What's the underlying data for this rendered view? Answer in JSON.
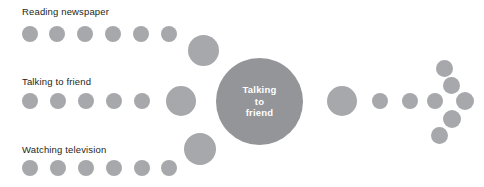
{
  "diagram": {
    "type": "bubble-flow",
    "background_color": "#ffffff",
    "node_color": "#a6a8ab",
    "hub_color": "#939598",
    "text_color": "#231f20",
    "hub": {
      "label_lines": [
        "Talking",
        "to",
        "friend"
      ],
      "x": 216,
      "y": 58,
      "size": 87
    },
    "labels": [
      {
        "text": "Reading newspaper",
        "x": 22,
        "y": 6
      },
      {
        "text": "Talking to friend",
        "x": 22,
        "y": 76
      },
      {
        "text": "Watching television",
        "x": 22,
        "y": 144
      }
    ],
    "nodes": [
      {
        "group": "reading-newspaper-row",
        "x": 22,
        "y": 26,
        "size": 16
      },
      {
        "group": "reading-newspaper-row",
        "x": 49,
        "y": 26,
        "size": 16
      },
      {
        "group": "reading-newspaper-row",
        "x": 77,
        "y": 26,
        "size": 16
      },
      {
        "group": "reading-newspaper-row",
        "x": 105,
        "y": 26,
        "size": 16
      },
      {
        "group": "reading-newspaper-row",
        "x": 133,
        "y": 26,
        "size": 16
      },
      {
        "group": "reading-newspaper-row",
        "x": 161,
        "y": 26,
        "size": 16
      },
      {
        "group": "reading-newspaper-merge",
        "x": 188,
        "y": 35,
        "size": 31
      },
      {
        "group": "talking-to-friend-row",
        "x": 22,
        "y": 93,
        "size": 16
      },
      {
        "group": "talking-to-friend-row",
        "x": 50,
        "y": 93,
        "size": 16
      },
      {
        "group": "talking-to-friend-row",
        "x": 78,
        "y": 93,
        "size": 16
      },
      {
        "group": "talking-to-friend-row",
        "x": 106,
        "y": 93,
        "size": 16
      },
      {
        "group": "talking-to-friend-row",
        "x": 134,
        "y": 93,
        "size": 16
      },
      {
        "group": "talking-to-friend-merge",
        "x": 166,
        "y": 86,
        "size": 30
      },
      {
        "group": "watching-television-row",
        "x": 22,
        "y": 160,
        "size": 16
      },
      {
        "group": "watching-television-row",
        "x": 50,
        "y": 160,
        "size": 16
      },
      {
        "group": "watching-television-row",
        "x": 78,
        "y": 160,
        "size": 16
      },
      {
        "group": "watching-television-row",
        "x": 106,
        "y": 160,
        "size": 16
      },
      {
        "group": "watching-television-row",
        "x": 134,
        "y": 160,
        "size": 16
      },
      {
        "group": "watching-television-row",
        "x": 161,
        "y": 160,
        "size": 16
      },
      {
        "group": "watching-television-merge",
        "x": 184,
        "y": 133,
        "size": 32
      },
      {
        "group": "output-stream",
        "x": 327,
        "y": 86,
        "size": 30
      },
      {
        "group": "output-stream",
        "x": 372,
        "y": 93,
        "size": 16
      },
      {
        "group": "output-stream",
        "x": 402,
        "y": 93,
        "size": 16
      },
      {
        "group": "output-fan",
        "x": 427,
        "y": 93,
        "size": 16
      },
      {
        "group": "output-fan",
        "x": 436,
        "y": 60,
        "size": 17
      },
      {
        "group": "output-fan",
        "x": 443,
        "y": 77,
        "size": 17
      },
      {
        "group": "output-fan",
        "x": 456,
        "y": 92,
        "size": 18
      },
      {
        "group": "output-fan",
        "x": 443,
        "y": 110,
        "size": 18
      },
      {
        "group": "output-fan",
        "x": 431,
        "y": 127,
        "size": 17
      }
    ]
  }
}
